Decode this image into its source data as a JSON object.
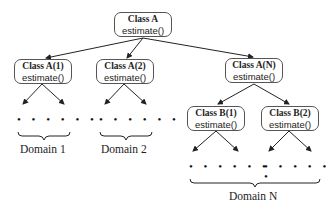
{
  "diagram": {
    "type": "class-hierarchy-tree",
    "nodes": [
      {
        "id": "A",
        "title": "Class A",
        "method": "estimate()"
      },
      {
        "id": "A1",
        "title": "Class A(1)",
        "method": "estimate()",
        "parent": "A"
      },
      {
        "id": "A2",
        "title": "Class A(2)",
        "method": "estimate()",
        "parent": "A"
      },
      {
        "id": "AN",
        "title": "Class A(N)",
        "method": "estimate()",
        "parent": "A"
      },
      {
        "id": "B1",
        "title": "Class B(1)",
        "method": "estimate()",
        "parent": "AN"
      },
      {
        "id": "B2",
        "title": "Class B(2)",
        "method": "estimate()",
        "parent": "AN"
      }
    ],
    "ellipsis": "• • • • • •",
    "domains": [
      {
        "label": "Domain 1"
      },
      {
        "label": "Domain 2"
      },
      {
        "label": "Domain N"
      }
    ]
  }
}
